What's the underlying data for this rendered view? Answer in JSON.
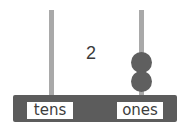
{
  "abacus": {
    "number_label": "2",
    "columns": [
      {
        "label": "tens",
        "beads": 0
      },
      {
        "label": "ones",
        "beads": 2
      }
    ],
    "colors": {
      "rod": "#a9a9a9",
      "bead": "#5f5f5f",
      "base": "#5c5c5c",
      "label_bg": "#ffffff",
      "text": "#3d3d3d"
    }
  }
}
